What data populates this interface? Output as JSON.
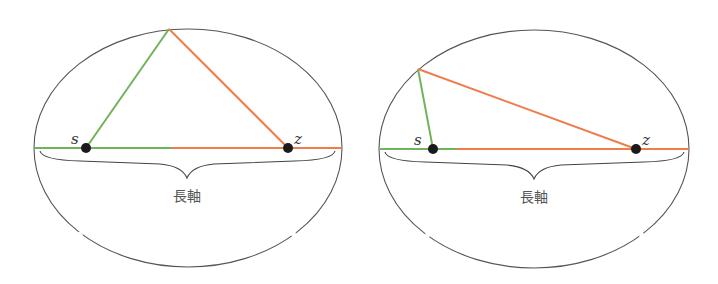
{
  "colors": {
    "ellipse": "#555555",
    "green_segment": "#6fb35a",
    "orange_segment": "#ef7d4a",
    "focus": "#1a1a1a",
    "label": "#555555"
  },
  "diagrams": [
    {
      "id": "left",
      "ellipse": {
        "cx": 188,
        "cy": 148,
        "rx": 154,
        "ry": 119
      },
      "axis_y": 148,
      "axis_left": 34,
      "axis_right": 342,
      "axis_color_split_x": 172,
      "focus_s": {
        "x": 86,
        "y": 148,
        "label": "s"
      },
      "focus_z": {
        "x": 288,
        "y": 148,
        "label": "z"
      },
      "vertex": {
        "x": 169,
        "y": 29
      },
      "brace": {
        "x1": 40,
        "x2": 335,
        "y": 151,
        "tip_y": 178
      },
      "axis_label": "長軸",
      "axis_label_pos": {
        "x": 187,
        "y": 201
      }
    },
    {
      "id": "right",
      "ellipse": {
        "cx": 534,
        "cy": 149,
        "rx": 155,
        "ry": 119
      },
      "axis_y": 149,
      "axis_left": 380,
      "axis_right": 689,
      "axis_color_split_x": 457,
      "focus_s": {
        "x": 433,
        "y": 149,
        "label": "s"
      },
      "focus_z": {
        "x": 636,
        "y": 149,
        "label": "z"
      },
      "vertex": {
        "x": 418,
        "y": 69
      },
      "brace": {
        "x1": 385,
        "x2": 684,
        "y": 152,
        "tip_y": 179
      },
      "axis_label": "長軸",
      "axis_label_pos": {
        "x": 534,
        "y": 202
      }
    }
  ]
}
